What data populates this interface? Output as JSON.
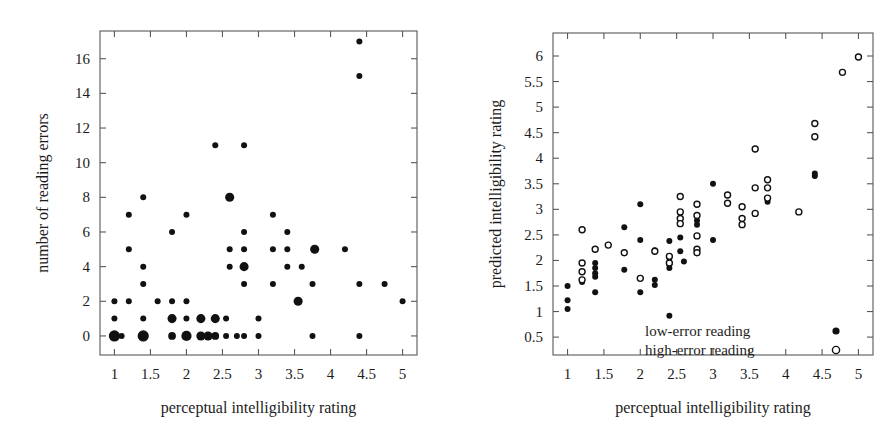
{
  "figure": {
    "background": "#ffffff",
    "ink": "#111111",
    "axis_color": "#55585a",
    "width": 894,
    "height": 441,
    "panel_count": 2
  },
  "chart_data": [
    {
      "type": "scatter",
      "panel": "left",
      "title": "",
      "xlabel": "perceptual intelligibility rating",
      "ylabel": "number of reading errors",
      "xlim": [
        0.8,
        5.2
      ],
      "ylim": [
        -1.1,
        17.6
      ],
      "xticks": [
        1,
        1.5,
        2,
        2.5,
        3,
        3.5,
        4,
        4.5,
        5
      ],
      "xtick_labels": [
        "1",
        "1.5",
        "2",
        "2.5",
        "3",
        "3.5",
        "4",
        "4.5",
        "5"
      ],
      "yticks": [
        0,
        2,
        4,
        6,
        8,
        10,
        12,
        14,
        16
      ],
      "ytick_labels": [
        "0",
        "2",
        "4",
        "6",
        "8",
        "10",
        "12",
        "14",
        "16"
      ],
      "grid": false,
      "legend": null,
      "marker_note": "marker area encodes number of overlapping observations",
      "series": [
        {
          "name": "reading errors",
          "marker": "filled-circle",
          "color": "#111111",
          "points": [
            {
              "x": 1.0,
              "y": 0,
              "w": 5
            },
            {
              "x": 1.0,
              "y": 1,
              "w": 1
            },
            {
              "x": 1.0,
              "y": 2,
              "w": 1
            },
            {
              "x": 1.1,
              "y": 0,
              "w": 1
            },
            {
              "x": 1.2,
              "y": 2,
              "w": 1
            },
            {
              "x": 1.2,
              "y": 5,
              "w": 1
            },
            {
              "x": 1.2,
              "y": 7,
              "w": 1
            },
            {
              "x": 1.4,
              "y": 0,
              "w": 5
            },
            {
              "x": 1.4,
              "y": 1,
              "w": 1
            },
            {
              "x": 1.4,
              "y": 3,
              "w": 1
            },
            {
              "x": 1.4,
              "y": 4,
              "w": 1
            },
            {
              "x": 1.4,
              "y": 8,
              "w": 1
            },
            {
              "x": 1.6,
              "y": 2,
              "w": 1
            },
            {
              "x": 1.8,
              "y": 0,
              "w": 2
            },
            {
              "x": 1.8,
              "y": 1,
              "w": 3
            },
            {
              "x": 1.8,
              "y": 2,
              "w": 1
            },
            {
              "x": 1.8,
              "y": 6,
              "w": 1
            },
            {
              "x": 2.0,
              "y": 0,
              "w": 4
            },
            {
              "x": 2.0,
              "y": 1,
              "w": 1
            },
            {
              "x": 2.0,
              "y": 2,
              "w": 1
            },
            {
              "x": 2.0,
              "y": 7,
              "w": 1
            },
            {
              "x": 2.2,
              "y": 0,
              "w": 3
            },
            {
              "x": 2.2,
              "y": 1,
              "w": 3
            },
            {
              "x": 2.3,
              "y": 0,
              "w": 3
            },
            {
              "x": 2.4,
              "y": 1,
              "w": 3
            },
            {
              "x": 2.4,
              "y": 0,
              "w": 2
            },
            {
              "x": 2.4,
              "y": 11,
              "w": 1
            },
            {
              "x": 2.55,
              "y": 0,
              "w": 1
            },
            {
              "x": 2.55,
              "y": 1,
              "w": 1
            },
            {
              "x": 2.6,
              "y": 4,
              "w": 1
            },
            {
              "x": 2.6,
              "y": 5,
              "w": 1
            },
            {
              "x": 2.6,
              "y": 8,
              "w": 3
            },
            {
              "x": 2.7,
              "y": 0,
              "w": 1
            },
            {
              "x": 2.8,
              "y": 0,
              "w": 1
            },
            {
              "x": 2.8,
              "y": 3,
              "w": 1
            },
            {
              "x": 2.8,
              "y": 4,
              "w": 3
            },
            {
              "x": 2.8,
              "y": 5,
              "w": 1
            },
            {
              "x": 2.8,
              "y": 6,
              "w": 1
            },
            {
              "x": 2.8,
              "y": 11,
              "w": 1
            },
            {
              "x": 3.0,
              "y": 0,
              "w": 1
            },
            {
              "x": 3.0,
              "y": 1,
              "w": 1
            },
            {
              "x": 3.2,
              "y": 3,
              "w": 1
            },
            {
              "x": 3.2,
              "y": 5,
              "w": 1
            },
            {
              "x": 3.2,
              "y": 7,
              "w": 1
            },
            {
              "x": 3.4,
              "y": 4,
              "w": 1
            },
            {
              "x": 3.4,
              "y": 5,
              "w": 1
            },
            {
              "x": 3.4,
              "y": 6,
              "w": 1
            },
            {
              "x": 3.55,
              "y": 2,
              "w": 3
            },
            {
              "x": 3.6,
              "y": 4,
              "w": 1
            },
            {
              "x": 3.75,
              "y": 0,
              "w": 1
            },
            {
              "x": 3.75,
              "y": 3,
              "w": 1
            },
            {
              "x": 3.78,
              "y": 5,
              "w": 3
            },
            {
              "x": 4.2,
              "y": 5,
              "w": 1
            },
            {
              "x": 4.4,
              "y": 0,
              "w": 1
            },
            {
              "x": 4.4,
              "y": 3,
              "w": 1
            },
            {
              "x": 4.4,
              "y": 15,
              "w": 1
            },
            {
              "x": 4.4,
              "y": 17,
              "w": 1
            },
            {
              "x": 4.75,
              "y": 3,
              "w": 1
            },
            {
              "x": 5.0,
              "y": 2,
              "w": 1
            }
          ]
        }
      ]
    },
    {
      "type": "scatter",
      "panel": "right",
      "title": "",
      "xlabel": "perceptual intelligibility rating",
      "ylabel": "predicted intelligibility rating",
      "xlim": [
        0.8,
        5.2
      ],
      "ylim": [
        0.15,
        6.45
      ],
      "xticks": [
        1,
        1.5,
        2,
        2.5,
        3,
        3.5,
        4,
        4.5,
        5
      ],
      "xtick_labels": [
        "1",
        "1.5",
        "2",
        "2.5",
        "3",
        "3.5",
        "4",
        "4.5",
        "5"
      ],
      "yticks": [
        0.5,
        1,
        1.5,
        2,
        2.5,
        3,
        3.5,
        4,
        4.5,
        5,
        5.5,
        6
      ],
      "ytick_labels": [
        "0.5",
        "1",
        "1.5",
        "2",
        "2.5",
        "3",
        "3.5",
        "4",
        "4.5",
        "5",
        "5.5",
        "6"
      ],
      "grid": false,
      "legend": {
        "position": "lower-center-right",
        "entries": [
          {
            "label": "low-error reading",
            "marker": "filled-circle",
            "color": "#111111"
          },
          {
            "label": "high-error reading",
            "marker": "open-circle",
            "color": "#111111"
          }
        ]
      },
      "series": [
        {
          "name": "low-error reading",
          "marker": "filled-circle",
          "color": "#111111",
          "points": [
            {
              "x": 1.0,
              "y": 1.5
            },
            {
              "x": 1.0,
              "y": 1.22
            },
            {
              "x": 1.0,
              "y": 1.05
            },
            {
              "x": 1.2,
              "y": 1.58
            },
            {
              "x": 1.38,
              "y": 1.95
            },
            {
              "x": 1.38,
              "y": 1.85
            },
            {
              "x": 1.38,
              "y": 1.75
            },
            {
              "x": 1.38,
              "y": 1.68
            },
            {
              "x": 1.38,
              "y": 1.38
            },
            {
              "x": 1.78,
              "y": 2.65
            },
            {
              "x": 1.78,
              "y": 1.82
            },
            {
              "x": 2.0,
              "y": 3.1
            },
            {
              "x": 2.0,
              "y": 2.4
            },
            {
              "x": 2.0,
              "y": 1.65
            },
            {
              "x": 2.0,
              "y": 1.38
            },
            {
              "x": 2.2,
              "y": 2.2
            },
            {
              "x": 2.2,
              "y": 1.62
            },
            {
              "x": 2.2,
              "y": 1.52
            },
            {
              "x": 2.4,
              "y": 2.38
            },
            {
              "x": 2.4,
              "y": 2.05
            },
            {
              "x": 2.4,
              "y": 1.92
            },
            {
              "x": 2.4,
              "y": 1.85
            },
            {
              "x": 2.4,
              "y": 0.92
            },
            {
              "x": 2.55,
              "y": 2.45
            },
            {
              "x": 2.55,
              "y": 2.18
            },
            {
              "x": 2.6,
              "y": 1.98
            },
            {
              "x": 2.78,
              "y": 2.78
            },
            {
              "x": 2.78,
              "y": 2.7
            },
            {
              "x": 3.0,
              "y": 3.5
            },
            {
              "x": 3.0,
              "y": 2.4
            },
            {
              "x": 3.75,
              "y": 3.15
            },
            {
              "x": 4.4,
              "y": 3.7
            },
            {
              "x": 4.4,
              "y": 3.65
            }
          ]
        },
        {
          "name": "high-error reading",
          "marker": "open-circle",
          "color": "#111111",
          "points": [
            {
              "x": 1.2,
              "y": 2.6
            },
            {
              "x": 1.2,
              "y": 1.95
            },
            {
              "x": 1.2,
              "y": 1.78
            },
            {
              "x": 1.2,
              "y": 1.62
            },
            {
              "x": 1.38,
              "y": 2.22
            },
            {
              "x": 1.56,
              "y": 2.3
            },
            {
              "x": 1.78,
              "y": 2.15
            },
            {
              "x": 2.0,
              "y": 1.65
            },
            {
              "x": 2.2,
              "y": 2.18
            },
            {
              "x": 2.4,
              "y": 2.08
            },
            {
              "x": 2.4,
              "y": 1.95
            },
            {
              "x": 2.55,
              "y": 3.25
            },
            {
              "x": 2.55,
              "y": 2.95
            },
            {
              "x": 2.55,
              "y": 2.82
            },
            {
              "x": 2.55,
              "y": 2.72
            },
            {
              "x": 2.78,
              "y": 3.1
            },
            {
              "x": 2.78,
              "y": 2.88
            },
            {
              "x": 2.78,
              "y": 2.48
            },
            {
              "x": 2.78,
              "y": 2.22
            },
            {
              "x": 2.78,
              "y": 2.15
            },
            {
              "x": 3.2,
              "y": 3.28
            },
            {
              "x": 3.2,
              "y": 3.12
            },
            {
              "x": 3.4,
              "y": 3.05
            },
            {
              "x": 3.4,
              "y": 2.82
            },
            {
              "x": 3.4,
              "y": 2.7
            },
            {
              "x": 3.58,
              "y": 4.18
            },
            {
              "x": 3.58,
              "y": 3.42
            },
            {
              "x": 3.58,
              "y": 2.92
            },
            {
              "x": 3.75,
              "y": 3.58
            },
            {
              "x": 3.75,
              "y": 3.42
            },
            {
              "x": 3.75,
              "y": 3.22
            },
            {
              "x": 4.18,
              "y": 2.95
            },
            {
              "x": 4.4,
              "y": 4.68
            },
            {
              "x": 4.4,
              "y": 4.42
            },
            {
              "x": 4.78,
              "y": 5.68
            },
            {
              "x": 5.0,
              "y": 5.98
            }
          ]
        }
      ]
    }
  ]
}
